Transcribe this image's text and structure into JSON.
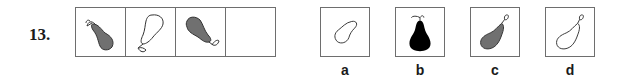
{
  "question": {
    "number": "13."
  },
  "sequence": [
    {
      "index": 1,
      "fill": "#707070",
      "description": "grey pear, stem upper-left, pointing upper-left"
    },
    {
      "index": 2,
      "fill": "none",
      "description": "outline pear, stem lower-left"
    },
    {
      "index": 3,
      "fill": "#707070",
      "description": "grey pear, stem lower-right"
    },
    {
      "index": 4,
      "fill": "empty",
      "description": "blank cell to be filled"
    }
  ],
  "options": [
    {
      "label": "a",
      "fill": "none",
      "description": "outline pear without stem, tilted right"
    },
    {
      "label": "b",
      "fill": "#000000",
      "description": "black pear upright with stem on top"
    },
    {
      "label": "c",
      "fill": "#707070",
      "description": "grey pear with stem upper-right"
    },
    {
      "label": "d",
      "fill": "none",
      "description": "outline pear with stem upper-right"
    }
  ],
  "colors": {
    "border": "#6e6e6e",
    "grey_fill": "#707070",
    "black_fill": "#000000",
    "text": "#1a1a1a"
  }
}
